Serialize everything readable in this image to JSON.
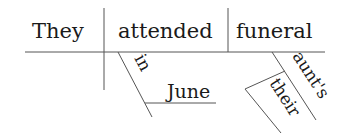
{
  "diagram": {
    "type": "sentence-diagram",
    "sentence": "They attended their aunt's funeral in June",
    "subject": "They",
    "verb": "attended",
    "object": "funeral",
    "modifiers": {
      "prepositional_phrase": {
        "preposition": "in",
        "object": "June",
        "modifies": "attended"
      },
      "possessive_modifier": {
        "word": "aunt's",
        "modifies": "funeral"
      },
      "nested_modifier": {
        "word": "their",
        "modifies": "aunt's"
      }
    },
    "colors": {
      "line": "#555555",
      "text": "#1a1a1a",
      "background": "#ffffff"
    }
  }
}
